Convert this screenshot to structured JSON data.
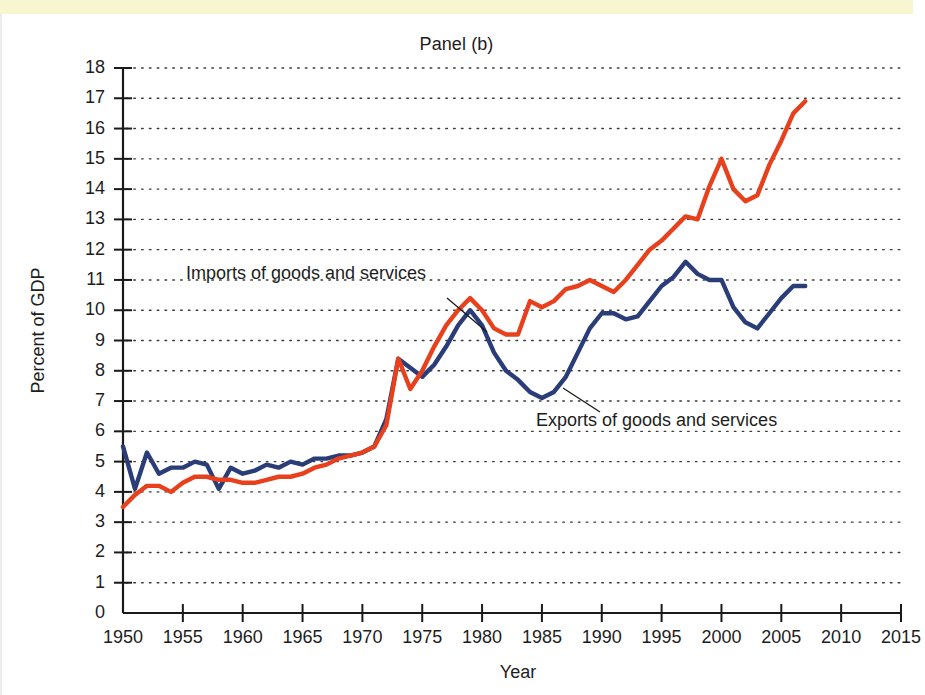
{
  "figure": {
    "title": "Panel (b)",
    "top_band_color": "#f7f6cd"
  },
  "axes": {
    "x_title": "Year",
    "y_title": "Percent of GDP",
    "x_ticks": [
      "1950",
      "1955",
      "1960",
      "1965",
      "1970",
      "1975",
      "1980",
      "1985",
      "1990",
      "1995",
      "2000",
      "2005",
      "2010",
      "2015"
    ],
    "y_ticks": [
      "18",
      "17",
      "16",
      "15",
      "14",
      "13",
      "12",
      "11",
      "10",
      "9",
      "8",
      "7",
      "6",
      "5",
      "4",
      "3",
      "2",
      "1",
      "0"
    ]
  },
  "annotations": {
    "imports_label": "Imports of goods and services",
    "exports_label": "Exports of goods and services"
  },
  "chart_data": {
    "type": "line",
    "title": "Panel (b)",
    "xlabel": "Year",
    "ylabel": "Percent of GDP",
    "xlim": [
      1950,
      2015
    ],
    "ylim": [
      0,
      18
    ],
    "xtick_step": 5,
    "ytick_step": 1,
    "grid": "horizontal-dotted",
    "legend": "inline-annotations-with-leader-lines",
    "colors": {
      "imports": "#e8401c",
      "exports": "#2b3d78"
    },
    "x": [
      1950,
      1951,
      1952,
      1953,
      1954,
      1955,
      1956,
      1957,
      1958,
      1959,
      1960,
      1961,
      1962,
      1963,
      1964,
      1965,
      1966,
      1967,
      1968,
      1969,
      1970,
      1971,
      1972,
      1973,
      1974,
      1975,
      1976,
      1977,
      1978,
      1979,
      1980,
      1981,
      1982,
      1983,
      1984,
      1985,
      1986,
      1987,
      1988,
      1989,
      1990,
      1991,
      1992,
      1993,
      1994,
      1995,
      1996,
      1997,
      1998,
      1999,
      2000,
      2001,
      2002,
      2003,
      2004,
      2005,
      2006,
      2007
    ],
    "series": [
      {
        "name": "Exports of goods and services",
        "color": "#2b3d78",
        "values": [
          5.5,
          4.1,
          5.3,
          4.6,
          4.8,
          4.8,
          5.0,
          4.9,
          4.1,
          4.8,
          4.6,
          4.7,
          4.9,
          4.8,
          5.0,
          4.9,
          5.1,
          5.1,
          5.2,
          5.2,
          5.3,
          5.5,
          6.4,
          8.4,
          8.1,
          7.8,
          8.2,
          8.8,
          9.5,
          10.0,
          9.5,
          8.6,
          8.0,
          7.7,
          7.3,
          7.1,
          7.3,
          7.8,
          8.6,
          9.4,
          9.9,
          9.9,
          9.7,
          9.8,
          10.3,
          10.8,
          11.1,
          11.6,
          11.2,
          11.0,
          11.0,
          10.1,
          9.6,
          9.4,
          9.9,
          10.4,
          10.8,
          10.8
        ]
      },
      {
        "name": "Imports of goods and services",
        "color": "#e8401c",
        "values": [
          3.5,
          3.9,
          4.2,
          4.2,
          4.0,
          4.3,
          4.5,
          4.5,
          4.4,
          4.4,
          4.3,
          4.3,
          4.4,
          4.5,
          4.5,
          4.6,
          4.8,
          4.9,
          5.1,
          5.2,
          5.3,
          5.5,
          6.2,
          8.4,
          7.4,
          8.0,
          8.8,
          9.5,
          10.0,
          10.4,
          10.0,
          9.4,
          9.2,
          9.2,
          10.3,
          10.1,
          10.3,
          10.7,
          10.8,
          11.0,
          10.8,
          10.6,
          11.0,
          11.5,
          12.0,
          12.3,
          12.7,
          13.1,
          13.0,
          14.1,
          15.0,
          14.0,
          13.6,
          13.8,
          14.8,
          15.6,
          16.5,
          16.9
        ]
      }
    ]
  }
}
